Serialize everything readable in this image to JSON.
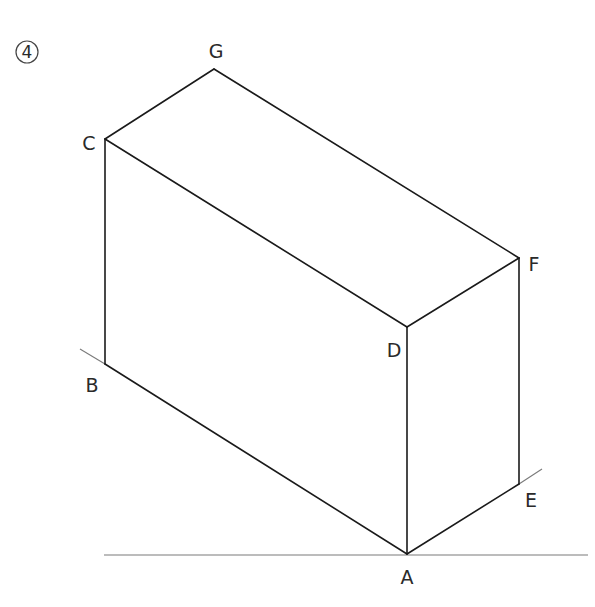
{
  "figure": {
    "number": "4"
  },
  "vertices": [
    {
      "id": "A",
      "label": "A",
      "x": 407,
      "y": 554
    },
    {
      "id": "B",
      "label": "B",
      "x": 105,
      "y": 364
    },
    {
      "id": "C",
      "label": "C",
      "x": 105,
      "y": 139
    },
    {
      "id": "D",
      "label": "D",
      "x": 407,
      "y": 327
    },
    {
      "id": "E",
      "label": "E",
      "x": 519,
      "y": 484
    },
    {
      "id": "F",
      "label": "F",
      "x": 519,
      "y": 258
    },
    {
      "id": "G",
      "label": "G",
      "x": 214,
      "y": 69
    }
  ],
  "edges": [
    [
      "A",
      "B"
    ],
    [
      "A",
      "D"
    ],
    [
      "A",
      "E"
    ],
    [
      "B",
      "C"
    ],
    [
      "C",
      "D"
    ],
    [
      "C",
      "G"
    ],
    [
      "D",
      "F"
    ],
    [
      "E",
      "F"
    ],
    [
      "F",
      "G"
    ]
  ],
  "construction_lines": [
    {
      "name": "baseline",
      "from": [
        104,
        555
      ],
      "to": [
        588,
        555
      ]
    },
    {
      "name": "extension-b",
      "from": [
        80,
        349
      ],
      "to": [
        105,
        364
      ]
    },
    {
      "name": "extension-e",
      "from": [
        519,
        484
      ],
      "to": [
        542,
        469
      ]
    }
  ],
  "labels": {
    "A": "A",
    "B": "B",
    "C": "C",
    "D": "D",
    "E": "E",
    "F": "F",
    "G": "G"
  }
}
